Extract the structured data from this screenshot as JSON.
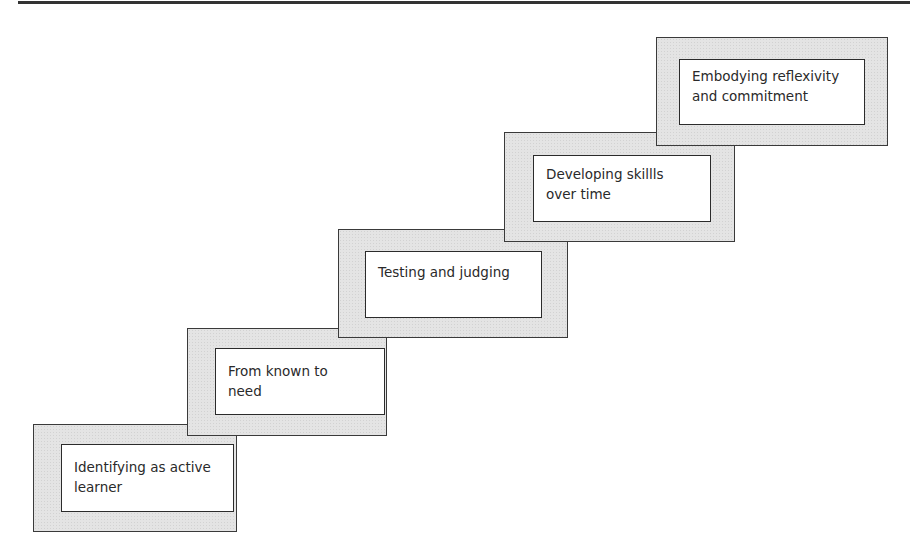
{
  "diagram": {
    "type": "staircase",
    "steps": [
      {
        "label": "Identifying as active learner",
        "lines": [
          "Identifying as active",
          "learner"
        ]
      },
      {
        "label": "From known to need",
        "lines": [
          "From known to",
          "need"
        ]
      },
      {
        "label": "Testing and judging",
        "lines": [
          "Testing and judging"
        ]
      },
      {
        "label": "Developing skillls over time",
        "lines": [
          "Developing skillls",
          "over time"
        ]
      },
      {
        "label": "Embodying reflexivity and commitment",
        "lines": [
          "Embodying reflexivity",
          "and commitment"
        ]
      }
    ]
  },
  "colors": {
    "frame_fill": "#e4e4e4",
    "border": "#3a3a3a",
    "inner_fill": "#ffffff"
  }
}
